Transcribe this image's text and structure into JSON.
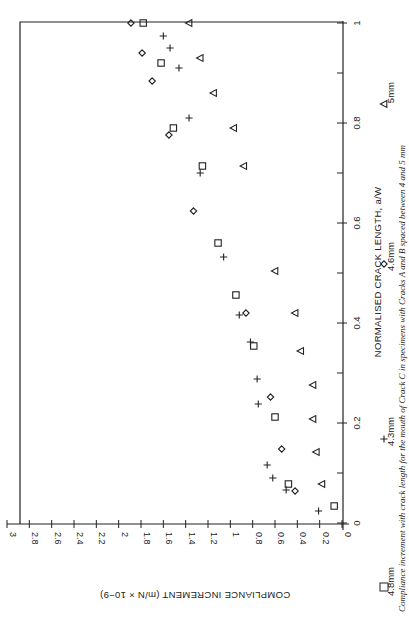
{
  "figure": {
    "rotation_deg": 90,
    "caption": "Compliance increment with crack length for the mouth of Crack C in specimens with Cracks A and B spaced between 4 and 5 mm"
  },
  "colors": {
    "ink": "#222222",
    "background": "#ffffff"
  },
  "chart_data": {
    "type": "scatter",
    "title": "",
    "xlabel": "NORMALISED CRACK LENGTH, a/W",
    "ylabel": "COMPLIANCE INCREMENT (m/N × 10−9)",
    "xlim": [
      0,
      1
    ],
    "ylim": [
      0,
      3
    ],
    "grid": false,
    "legend_position": "bottom (below x-axis label)",
    "x_ticks": [
      "0",
      "0.2",
      "0.4",
      "0.6",
      "0.8",
      "1"
    ],
    "x_minor_ticks": [
      0.1,
      0.3,
      0.5,
      0.7,
      0.9
    ],
    "y_ticks": [
      "0",
      "0.2",
      "0.4",
      "0.6",
      "0.8",
      "1",
      "1.2",
      "1.4",
      "1.6",
      "1.8",
      "2",
      "2.2",
      "2.4",
      "2.6",
      "2.8",
      "3"
    ],
    "series": [
      {
        "name": "4.8mm",
        "marker": "square",
        "points": [
          [
            0.034,
            0.07
          ],
          [
            0.078,
            0.48
          ],
          [
            0.212,
            0.6
          ],
          [
            0.354,
            0.79
          ],
          [
            0.456,
            0.95
          ],
          [
            0.56,
            1.11
          ],
          [
            0.714,
            1.25
          ],
          [
            0.79,
            1.51
          ],
          [
            0.92,
            1.62
          ],
          [
            1.0,
            1.78
          ]
        ]
      },
      {
        "name": "4.3mm",
        "marker": "plus",
        "points": [
          [
            0.024,
            0.21
          ],
          [
            0.066,
            0.5
          ],
          [
            0.09,
            0.62
          ],
          [
            0.116,
            0.67
          ],
          [
            0.238,
            0.75
          ],
          [
            0.288,
            0.76
          ],
          [
            0.362,
            0.82
          ],
          [
            0.416,
            0.92
          ],
          [
            0.532,
            1.06
          ],
          [
            0.7,
            1.27
          ],
          [
            0.81,
            1.37
          ],
          [
            0.91,
            1.46
          ],
          [
            0.95,
            1.54
          ],
          [
            0.974,
            1.6
          ]
        ]
      },
      {
        "name": "4.6mm",
        "marker": "diamond",
        "points": [
          [
            0.064,
            0.42
          ],
          [
            0.148,
            0.54
          ],
          [
            0.252,
            0.64
          ],
          [
            0.42,
            0.86
          ],
          [
            0.624,
            1.33
          ],
          [
            0.776,
            1.55
          ],
          [
            0.884,
            1.7
          ],
          [
            0.94,
            1.79
          ],
          [
            1.0,
            1.89
          ]
        ]
      },
      {
        "name": "5mm",
        "marker": "triangle-left",
        "points": [
          [
            0.078,
            0.18
          ],
          [
            0.142,
            0.23
          ],
          [
            0.208,
            0.26
          ],
          [
            0.276,
            0.26
          ],
          [
            0.344,
            0.37
          ],
          [
            0.42,
            0.42
          ],
          [
            0.504,
            0.6
          ],
          [
            0.714,
            0.88
          ],
          [
            0.79,
            0.97
          ],
          [
            0.86,
            1.15
          ],
          [
            0.93,
            1.27
          ],
          [
            1.0,
            1.37
          ]
        ]
      }
    ]
  }
}
